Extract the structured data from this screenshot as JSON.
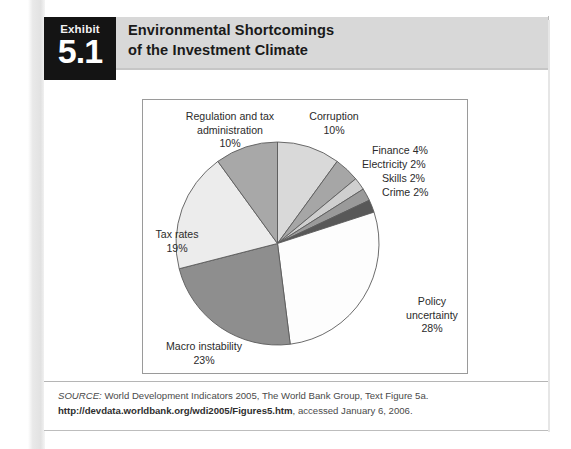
{
  "exhibit": {
    "tab_word": "Exhibit",
    "tab_number": "5.1",
    "title_line1": "Environmental Shortcomings",
    "title_line2": "of the Investment Climate"
  },
  "source": {
    "label": "SOURCE:",
    "text_before_url": " World Development Indicators 2005, The World Bank Group, Text Figure 5a. ",
    "url_part1": "http://devdata",
    "url_part2": ".worldbank.org/wdi2005/Figures5.htm",
    "text_after_url": ", accessed January 6, 2006."
  },
  "chart_data": {
    "type": "pie",
    "title": "Environmental Shortcomings of the Investment Climate",
    "unit": "percent",
    "start_angle_deg": 0,
    "direction": "clockwise",
    "legend": "none (direct labels)",
    "categories": [
      "Corruption",
      "Finance",
      "Electricity",
      "Skills",
      "Crime",
      "Policy uncertainty",
      "Macro instability",
      "Tax rates",
      "Regulation and tax administration"
    ],
    "values": [
      10,
      4,
      2,
      2,
      2,
      28,
      23,
      19,
      10
    ],
    "colors": [
      "#d9d9d9",
      "#a6a6a6",
      "#cfcfcf",
      "#9a9a9a",
      "#585858",
      "#fdfdfd",
      "#8e8e8e",
      "#ececec",
      "#a8a8a8"
    ],
    "slices": [
      {
        "name": "Corruption",
        "value": 10,
        "label": "Corruption",
        "value_label": "10%",
        "color": "#d9d9d9"
      },
      {
        "name": "Finance",
        "value": 4,
        "label": "Finance 4%",
        "value_label": "4%",
        "color": "#a6a6a6"
      },
      {
        "name": "Electricity",
        "value": 2,
        "label": "Electricity 2%",
        "value_label": "2%",
        "color": "#cfcfcf"
      },
      {
        "name": "Skills",
        "value": 2,
        "label": "Skills 2%",
        "value_label": "2%",
        "color": "#9a9a9a"
      },
      {
        "name": "Crime",
        "value": 2,
        "label": "Crime 2%",
        "value_label": "2%",
        "color": "#585858"
      },
      {
        "name": "Policy uncertainty",
        "value": 28,
        "label": "Policy uncertainty",
        "value_label": "28%",
        "color": "#fdfdfd"
      },
      {
        "name": "Macro instability",
        "value": 23,
        "label": "Macro instability",
        "value_label": "23%",
        "color": "#8e8e8e"
      },
      {
        "name": "Tax rates",
        "value": 19,
        "label": "Tax rates",
        "value_label": "19%",
        "color": "#ececec"
      },
      {
        "name": "Regulation and tax administration",
        "value": 10,
        "label": "Regulation and tax administration",
        "value_label": "10%",
        "color": "#a8a8a8"
      }
    ]
  },
  "labels": {
    "regulation_l1": "Regulation and tax",
    "regulation_l2": "administration",
    "regulation_pct": "10%",
    "corruption_l1": "Corruption",
    "corruption_pct": "10%",
    "finance": "Finance 4%",
    "electricity": "Electricity 2%",
    "skills": "Skills 2%",
    "crime": "Crime 2%",
    "policy_l1": "Policy",
    "policy_l2": "uncertainty",
    "policy_pct": "28%",
    "macro_l1": "Macro instability",
    "macro_pct": "23%",
    "tax_l1": "Tax rates",
    "tax_pct": "19%"
  }
}
